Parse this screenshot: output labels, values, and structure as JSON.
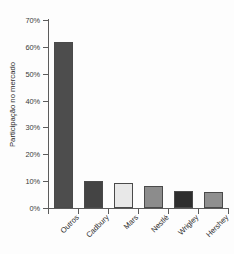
{
  "chart_data": {
    "type": "bar",
    "title": "",
    "subtitle": "",
    "xlabel": "",
    "ylabel": "Participação no mercado",
    "categories": [
      "Outros",
      "Cadbury",
      "Mars",
      "Nestlé",
      "Wrigley",
      "Hershey"
    ],
    "values": [
      62,
      10,
      9.3,
      8.3,
      6.3,
      6
    ],
    "value_labels": [
      "62%",
      "10%",
      "9.3%",
      "8.3%",
      "6.3%",
      "6%"
    ],
    "bar_colors": [
      "#4d4d4d",
      "#444444",
      "#e8e8e8",
      "#8c8c8c",
      "#2e2e2e",
      "#8f8f8f"
    ],
    "bar_border_color": "#4a4a4a",
    "ylim": [
      0,
      70
    ],
    "ytick_values": [
      0,
      10,
      20,
      30,
      40,
      50,
      60,
      70
    ],
    "ytick_labels": [
      "0%",
      "10%",
      "20%",
      "30%",
      "40%",
      "50%",
      "60%",
      "70%"
    ],
    "grid": false,
    "legend": null,
    "legend_position": "none",
    "axis_color": "#5c5c5c",
    "background": "#ffffff"
  }
}
